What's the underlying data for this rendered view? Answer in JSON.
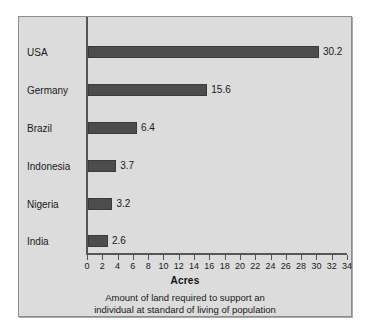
{
  "chart_data": {
    "type": "bar",
    "orientation": "horizontal",
    "title": "",
    "categories": [
      "USA",
      "Germany",
      "Brazil",
      "Indonesia",
      "Nigeria",
      "India"
    ],
    "values": [
      30.2,
      15.6,
      6.4,
      3.7,
      3.2,
      2.6
    ],
    "value_labels": [
      "30.2",
      "15.6",
      "6.4",
      "3.7",
      "3.2",
      "2.6"
    ],
    "xlabel": "Acres",
    "ylabel": "",
    "xlim": [
      0,
      34
    ],
    "xticks": [
      0,
      2,
      4,
      6,
      8,
      10,
      12,
      14,
      16,
      18,
      20,
      22,
      24,
      26,
      28,
      30,
      32,
      34
    ],
    "xtick_labels": [
      "0",
      "2",
      "4",
      "6",
      "8",
      "10",
      "12",
      "14",
      "16",
      "18",
      "20",
      "22",
      "24",
      "26",
      "28",
      "30",
      "32",
      "34"
    ],
    "grid": false,
    "legend": null,
    "caption_lines": [
      "Amount of land required to support an",
      "individual at standard of living of population"
    ],
    "colors": {
      "bar": "#4d4d4d",
      "background": "#dcdcdc",
      "axis": "#555555",
      "text": "#1a1a1a",
      "frame_border": "#8d8d8d"
    }
  }
}
